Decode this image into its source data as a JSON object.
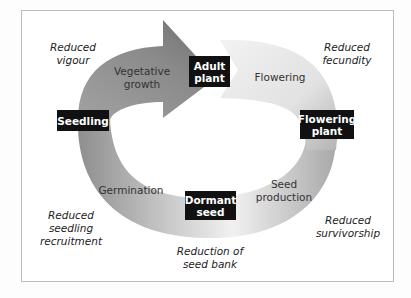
{
  "diagram": {
    "type": "life-cycle",
    "colors": {
      "dark_arrow": "#7d7d7d",
      "light_arrow": "#e6e6e6",
      "ring_mid": "#c4c4c4",
      "box_bg": "#111111",
      "box_text": "#ffffff",
      "frame": "#bdbdbd"
    },
    "life_stages": {
      "seedling": "Seedling",
      "adult_plant_line1": "Adult",
      "adult_plant_line2": "plant",
      "flowering_plant_line1": "Flowering",
      "flowering_plant_line2": "plant",
      "dormant_seed_line1": "Dormant",
      "dormant_seed_line2": "seed"
    },
    "processes": {
      "vegetative_growth_line1": "Vegetative",
      "vegetative_growth_line2": "growth",
      "flowering": "Flowering",
      "seed_production_line1": "Seed",
      "seed_production_line2": "production",
      "germination": "Germination"
    },
    "effects": {
      "reduced_vigour_line1": "Reduced",
      "reduced_vigour_line2": "vigour",
      "reduced_fecundity_line1": "Reduced",
      "reduced_fecundity_line2": "fecundity",
      "reduced_seedling_recruitment_line1": "Reduced",
      "reduced_seedling_recruitment_line2": "seedling",
      "reduced_seedling_recruitment_line3": "recruitment",
      "reduced_survivorship_line1": "Reduced",
      "reduced_survivorship_line2": "survivorship",
      "reduction_of_seed_bank_line1": "Reduction of",
      "reduction_of_seed_bank_line2": "seed bank"
    }
  }
}
